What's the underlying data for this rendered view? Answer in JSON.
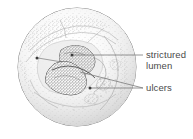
{
  "figure": {
    "background_color": "#ffffff"
  },
  "colors": {
    "outline": "#6b6b6b",
    "stipple_light": "#b9b9b9",
    "stipple_mid": "#909090",
    "lumen_fill": "#9a9a9a",
    "lumen_outline": "#555555",
    "leader_line": "#7a7a7a",
    "text": "#4a4a4a",
    "marker_dot": "#3c3c3c"
  },
  "specimen": {
    "name": "bowel-cross-section",
    "circle": {
      "cx": 77,
      "cy": 67,
      "r": 60
    },
    "lumen": {
      "name": "strictured-lumen",
      "upper_lobe_label": "upper lobe",
      "lower_lobe_label": "lower lobe"
    }
  },
  "labels": [
    {
      "id": "strictured-lumen",
      "lines": [
        "strictured",
        "lumen"
      ],
      "text_x": 146,
      "text_y": 56,
      "line_height": 11,
      "leader": {
        "x1": 72,
        "y1": 55,
        "x2": 143,
        "y2": 55
      },
      "marker": {
        "cx": 72,
        "cy": 55,
        "r": 1.6
      }
    },
    {
      "id": "ulcers",
      "lines": [
        "ulcers"
      ],
      "text_x": 146,
      "text_y": 91,
      "line_height": 11,
      "leader": {
        "x1": 90,
        "y1": 88,
        "x2": 143,
        "y2": 88
      },
      "marker": {
        "cx": 90,
        "cy": 88,
        "r": 1.6
      },
      "second_leader": {
        "x1": 71,
        "y1": 72,
        "x2": 143,
        "y2": 88
      },
      "second_marker": {
        "cx": 37,
        "cy": 58,
        "r": 1.6
      },
      "third_leader": {
        "x1": 37,
        "y1": 58,
        "x2": 78,
        "y2": 62
      }
    }
  ]
}
